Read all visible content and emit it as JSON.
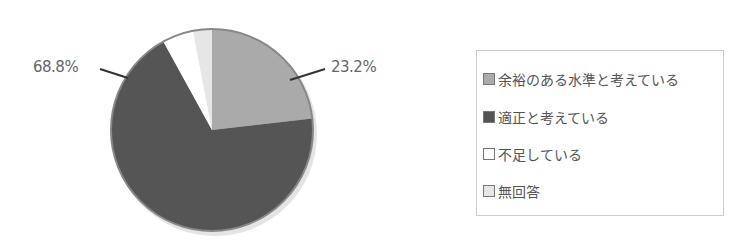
{
  "chart_data": {
    "type": "pie",
    "title": "",
    "categories": [
      "余裕のある水準と考えている",
      "適正と考えている",
      "不足している",
      "無回答"
    ],
    "values": [
      23.2,
      68.8,
      5.0,
      3.0
    ],
    "colors": [
      "#aaaaaa",
      "#555555",
      "#ffffff",
      "#e6e6e6"
    ],
    "data_labels": [
      "23.2%",
      "68.8%"
    ],
    "legend_position": "right"
  },
  "labels": {
    "slice_a": "23.2%",
    "slice_b": "68.8%"
  },
  "legend": {
    "items": [
      {
        "label": "余裕のある水準と考えている",
        "color": "#aaaaaa"
      },
      {
        "label": "適正と考えている",
        "color": "#555555"
      },
      {
        "label": "不足している",
        "color": "#ffffff"
      },
      {
        "label": "無回答",
        "color": "#e6e6e6"
      }
    ]
  }
}
